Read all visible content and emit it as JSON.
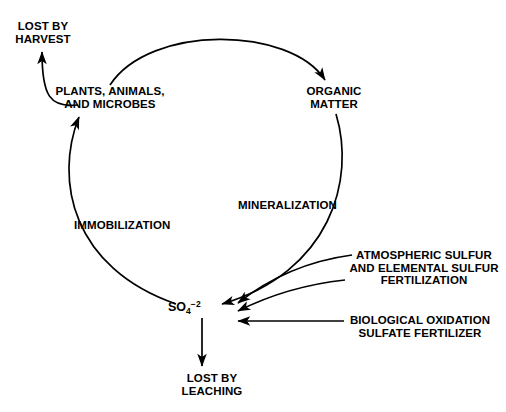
{
  "diagram": {
    "type": "cycle-diagram",
    "background_color": "#ffffff",
    "stroke_color": "#000000",
    "nodes": {
      "lost_harvest": "LOST BY\nHARVEST",
      "plants": "PLANTS, ANIMALS,\nAND MICROBES",
      "organic_matter": "ORGANIC\nMATTER",
      "sulfate_ion": {
        "base": "SO",
        "subscript": "4",
        "superscript": "−2",
        "full": "SO4-2"
      },
      "lost_leaching": "LOST BY\nLEACHING"
    },
    "process_labels": {
      "mineralization": "MINERALIZATION",
      "immobilization": "IMMOBILIZATION",
      "atmospheric": "ATMOSPHERIC SULFUR\nAND ELEMENTAL SULFUR\nFERTILIZATION",
      "biological": "BIOLOGICAL OXIDATION\nSULFATE FERTILIZER"
    },
    "arrows": [
      {
        "name": "plants-to-organic-matter",
        "from": "plants",
        "to": "organic_matter"
      },
      {
        "name": "organic-matter-to-sulfate",
        "from": "organic_matter",
        "to": "sulfate_ion",
        "label": "MINERALIZATION"
      },
      {
        "name": "sulfate-to-plants",
        "from": "sulfate_ion",
        "to": "plants",
        "label": "IMMOBILIZATION"
      },
      {
        "name": "plants-to-lost-harvest",
        "from": "plants",
        "to": "lost_harvest"
      },
      {
        "name": "sulfate-to-lost-leaching",
        "from": "sulfate_ion",
        "to": "lost_leaching"
      },
      {
        "name": "atmospheric-to-sulfate",
        "from": "atmospheric",
        "to": "sulfate_ion"
      },
      {
        "name": "elemental-to-sulfate",
        "from": "atmospheric",
        "to": "sulfate_ion"
      },
      {
        "name": "biological-to-sulfate",
        "from": "biological",
        "to": "sulfate_ion"
      }
    ]
  }
}
